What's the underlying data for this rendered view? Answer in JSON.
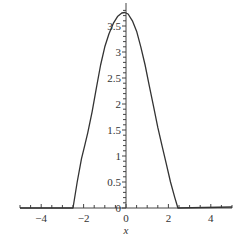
{
  "chart_data": {
    "type": "line",
    "title": "",
    "xlabel": "x",
    "ylabel": "",
    "xlim": [
      -5,
      5
    ],
    "ylim": [
      0,
      3.85
    ],
    "grid": false,
    "legend": "none",
    "x_ticks": [
      -4,
      -2,
      0,
      2,
      4
    ],
    "x_tick_labels": [
      "-4",
      "-2",
      "0",
      "2",
      "4"
    ],
    "x_minor_step": 0.5,
    "y_ticks": [
      0,
      0.5,
      1,
      1.5,
      2,
      2.5,
      3,
      3.5
    ],
    "y_tick_labels": [
      "0",
      "0.5",
      "1",
      "1.5",
      "2",
      "2.5",
      "3",
      "3.5"
    ],
    "y_minor_step": 0.1,
    "series": [
      {
        "name": "f(x)",
        "color": "#333333",
        "x": [
          -5,
          -2.5,
          -2.3,
          -2.1,
          -1.95,
          -1.8,
          -1.6,
          -1.4,
          -1.2,
          -1.0,
          -0.8,
          -0.6,
          -0.4,
          -0.2,
          -0.05,
          0.1,
          0.3,
          0.5,
          0.7,
          0.9,
          1.1,
          1.3,
          1.5,
          1.7,
          1.9,
          2.1,
          2.3,
          2.45,
          5
        ],
        "y": [
          0,
          0,
          0.5,
          0.95,
          1.2,
          1.45,
          1.85,
          2.3,
          2.75,
          3.1,
          3.35,
          3.55,
          3.68,
          3.75,
          3.76,
          3.73,
          3.6,
          3.4,
          3.1,
          2.75,
          2.35,
          1.95,
          1.55,
          1.2,
          0.85,
          0.5,
          0.2,
          0,
          0.02
        ]
      }
    ]
  }
}
